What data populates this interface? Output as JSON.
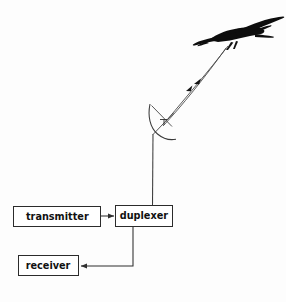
{
  "diagram": {
    "background_color": "#fdfdfd",
    "line_color": "#3a3a3a",
    "aircraft_color": "#0d0d0d",
    "box_border_color": "#2b2b2b",
    "nodes": [
      {
        "id": "transmitter",
        "label": "transmitter"
      },
      {
        "id": "duplexer",
        "label": "duplexer"
      },
      {
        "id": "receiver",
        "label": "receiver"
      }
    ],
    "elements": {
      "aircraft": "aircraft-silhouette",
      "antenna": "parabolic-dish-antenna",
      "feed": "antenna-feed-horn",
      "mast": "antenna-mast",
      "beam_outgoing": "radar-beam-transmit",
      "beam_incoming": "radar-beam-echo"
    },
    "connections": [
      {
        "from": "transmitter",
        "to": "duplexer",
        "arrow": "right"
      },
      {
        "from": "duplexer",
        "to": "receiver",
        "arrow": "left"
      },
      {
        "from": "duplexer",
        "to": "antenna",
        "arrow": "none"
      },
      {
        "from": "antenna",
        "to": "aircraft",
        "arrow": "up-right"
      }
    ],
    "caption": ""
  }
}
